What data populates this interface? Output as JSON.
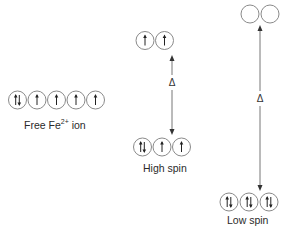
{
  "diagram": {
    "colors": {
      "line": "#555555",
      "circle": "#888888",
      "text": "#2a2a2a",
      "background": "#ffffff"
    },
    "free_ion": {
      "label_main": "Free  Fe",
      "label_sup": "2+",
      "label_tail": " ion",
      "orbitals": [
        "up-down",
        "up",
        "up",
        "up",
        "up"
      ]
    },
    "high_spin": {
      "label": "High spin",
      "upper_orbitals": [
        "up",
        "up"
      ],
      "lower_orbitals": [
        "up-down",
        "up",
        "up"
      ],
      "gap_symbol": "Δ"
    },
    "low_spin": {
      "label": "Low spin",
      "upper_orbitals": [
        "empty",
        "empty"
      ],
      "lower_orbitals": [
        "up-down",
        "up-down",
        "up-down"
      ],
      "gap_symbol": "Δ"
    }
  }
}
